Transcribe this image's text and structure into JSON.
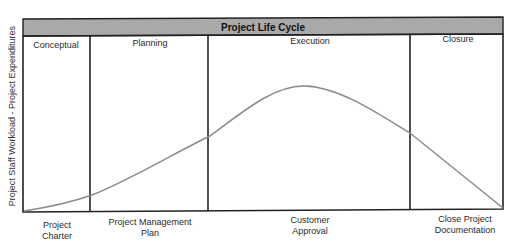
{
  "diagram": {
    "title": "Project Life Cycle",
    "y_axis_label": "Project Staff Workload - Project Expenditures",
    "phases": [
      {
        "label": "Conceptual"
      },
      {
        "label": "Planning"
      },
      {
        "label": "Execution"
      },
      {
        "label": "Closure"
      }
    ],
    "milestones": [
      {
        "line1": "Project",
        "line2": "Charter"
      },
      {
        "line1": "Project Management",
        "line2": "Plan"
      },
      {
        "line1": "Customer",
        "line2": "Approval"
      },
      {
        "line1": "Close Project",
        "line2": "Documentation"
      }
    ],
    "colors": {
      "header_fill": "#a9a9a9",
      "frame": "#222222",
      "curve": "#8a8a8a"
    }
  }
}
